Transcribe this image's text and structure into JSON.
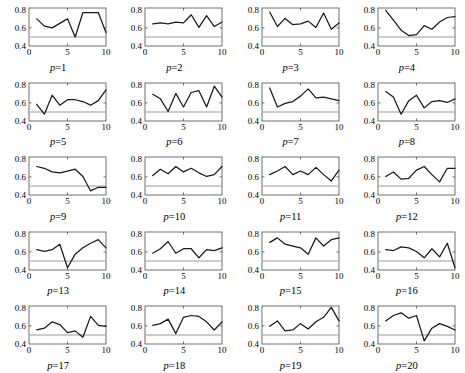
{
  "figure": {
    "layout": {
      "rows": 5,
      "cols": 4,
      "panels": 20
    },
    "background_color": "#ffffff",
    "line_color": "#1a1a1a",
    "reference_line_color": "#9a9a9a",
    "axis_color": "#4d4d4d"
  },
  "chart_data": [
    {
      "type": "line",
      "title": "p=1",
      "label_prefix": "p",
      "label_value": "1",
      "xlabel": "",
      "ylabel": "",
      "xlim": [
        0,
        10
      ],
      "ylim": [
        0.4,
        0.82
      ],
      "xticks": [
        0,
        5,
        10
      ],
      "xtick_labels": [
        "0",
        "5",
        "10"
      ],
      "yticks": [
        0.4,
        0.6,
        0.8
      ],
      "ytick_labels": [
        "0.4",
        "0.6",
        "0.8"
      ],
      "grid": false,
      "x": [
        1,
        2,
        3,
        4,
        5,
        6,
        7,
        8,
        9,
        10
      ],
      "values": [
        0.7,
        0.62,
        0.6,
        0.65,
        0.7,
        0.5,
        0.77,
        0.77,
        0.77,
        0.55
      ],
      "reference_line": 0.5
    },
    {
      "type": "line",
      "title": "p=2",
      "label_prefix": "p",
      "label_value": "2",
      "xlim": [
        0,
        10
      ],
      "ylim": [
        0.4,
        0.82
      ],
      "xticks": [
        0,
        5,
        10
      ],
      "xtick_labels": [
        "0",
        "5",
        "10"
      ],
      "yticks": [
        0.4,
        0.6,
        0.8
      ],
      "ytick_labels": [
        "0.4",
        "0.6",
        "0.8"
      ],
      "grid": false,
      "x": [
        1,
        2,
        3,
        4,
        5,
        6,
        7,
        8,
        9,
        10
      ],
      "values": [
        0.645,
        0.655,
        0.645,
        0.665,
        0.655,
        0.745,
        0.605,
        0.735,
        0.615,
        0.665
      ],
      "reference_line": 0.5
    },
    {
      "type": "line",
      "title": "p=3",
      "label_prefix": "p",
      "label_value": "3",
      "xlim": [
        0,
        10
      ],
      "ylim": [
        0.4,
        0.82
      ],
      "xticks": [
        0,
        5,
        10
      ],
      "xtick_labels": [
        "0",
        "5",
        "10"
      ],
      "yticks": [
        0.4,
        0.6,
        0.8
      ],
      "ytick_labels": [
        "0.4",
        "0.6",
        "0.8"
      ],
      "grid": false,
      "x": [
        1,
        2,
        3,
        4,
        5,
        6,
        7,
        8,
        9,
        10
      ],
      "values": [
        0.775,
        0.615,
        0.705,
        0.635,
        0.645,
        0.675,
        0.605,
        0.765,
        0.585,
        0.655
      ],
      "reference_line": 0.5
    },
    {
      "type": "line",
      "title": "p=4",
      "label_prefix": "p",
      "label_value": "4",
      "xlim": [
        0,
        10
      ],
      "ylim": [
        0.4,
        0.82
      ],
      "xticks": [
        0,
        5,
        10
      ],
      "xtick_labels": [
        "0",
        "5",
        "10"
      ],
      "yticks": [
        0.4,
        0.6,
        0.8
      ],
      "ytick_labels": [
        "0.4",
        "0.6",
        "0.8"
      ],
      "grid": false,
      "x": [
        1,
        2,
        3,
        4,
        5,
        6,
        7,
        8,
        9,
        10
      ],
      "values": [
        0.795,
        0.685,
        0.575,
        0.515,
        0.525,
        0.625,
        0.585,
        0.665,
        0.715,
        0.725
      ],
      "reference_line": 0.5
    },
    {
      "type": "line",
      "title": "p=5",
      "label_prefix": "p",
      "label_value": "5",
      "xlim": [
        0,
        10
      ],
      "ylim": [
        0.4,
        0.82
      ],
      "xticks": [
        0,
        5,
        10
      ],
      "xtick_labels": [
        "0",
        "5",
        "10"
      ],
      "yticks": [
        0.4,
        0.6,
        0.8
      ],
      "ytick_labels": [
        "0.4",
        "0.6",
        "0.8"
      ],
      "grid": false,
      "x": [
        1,
        2,
        3,
        4,
        5,
        6,
        7,
        8,
        9,
        10
      ],
      "values": [
        0.585,
        0.475,
        0.685,
        0.575,
        0.635,
        0.635,
        0.615,
        0.575,
        0.625,
        0.745
      ],
      "reference_line": 0.5
    },
    {
      "type": "line",
      "title": "p=6",
      "label_prefix": "p",
      "label_value": "6",
      "xlim": [
        0,
        10
      ],
      "ylim": [
        0.4,
        0.82
      ],
      "xticks": [
        0,
        5,
        10
      ],
      "xtick_labels": [
        "0",
        "5",
        "10"
      ],
      "yticks": [
        0.4,
        0.6,
        0.8
      ],
      "ytick_labels": [
        "0.4",
        "0.6",
        "0.8"
      ],
      "grid": false,
      "x": [
        1,
        2,
        3,
        4,
        5,
        6,
        7,
        8,
        9,
        10
      ],
      "values": [
        0.695,
        0.645,
        0.505,
        0.705,
        0.555,
        0.715,
        0.735,
        0.555,
        0.785,
        0.665
      ],
      "reference_line": 0.5
    },
    {
      "type": "line",
      "title": "p=7",
      "label_prefix": "p",
      "label_value": "7",
      "xlim": [
        0,
        10
      ],
      "ylim": [
        0.4,
        0.82
      ],
      "xticks": [
        0,
        5,
        10
      ],
      "xtick_labels": [
        "0",
        "5",
        "10"
      ],
      "yticks": [
        0.4,
        0.6,
        0.8
      ],
      "ytick_labels": [
        "0.4",
        "0.6",
        "0.8"
      ],
      "grid": false,
      "x": [
        1,
        2,
        3,
        4,
        5,
        6,
        7,
        8,
        9,
        10
      ],
      "values": [
        0.765,
        0.555,
        0.595,
        0.615,
        0.675,
        0.755,
        0.655,
        0.665,
        0.645,
        0.625
      ],
      "reference_line": 0.5
    },
    {
      "type": "line",
      "title": "p=8",
      "label_prefix": "p",
      "label_value": "8",
      "xlim": [
        0,
        10
      ],
      "ylim": [
        0.4,
        0.82
      ],
      "xticks": [
        0,
        5,
        10
      ],
      "xtick_labels": [
        "0",
        "5",
        "10"
      ],
      "yticks": [
        0.4,
        0.6,
        0.8
      ],
      "ytick_labels": [
        "0.4",
        "0.6",
        "0.8"
      ],
      "grid": false,
      "x": [
        1,
        2,
        3,
        4,
        5,
        6,
        7,
        8,
        9,
        10
      ],
      "values": [
        0.725,
        0.665,
        0.475,
        0.625,
        0.685,
        0.545,
        0.615,
        0.625,
        0.605,
        0.645
      ],
      "reference_line": 0.5
    },
    {
      "type": "line",
      "title": "p=9",
      "label_prefix": "p",
      "label_value": "9",
      "xlim": [
        0,
        10
      ],
      "ylim": [
        0.4,
        0.82
      ],
      "xticks": [
        0,
        5,
        10
      ],
      "xtick_labels": [
        "0",
        "5",
        "10"
      ],
      "yticks": [
        0.4,
        0.6,
        0.8
      ],
      "ytick_labels": [
        "0.4",
        "0.6",
        "0.8"
      ],
      "grid": false,
      "x": [
        1,
        2,
        3,
        4,
        5,
        6,
        7,
        8,
        9,
        10
      ],
      "values": [
        0.715,
        0.695,
        0.655,
        0.645,
        0.665,
        0.685,
        0.605,
        0.445,
        0.485,
        0.485
      ],
      "reference_line": 0.5
    },
    {
      "type": "line",
      "title": "p=10",
      "label_prefix": "p",
      "label_value": "10",
      "xlim": [
        0,
        10
      ],
      "ylim": [
        0.4,
        0.82
      ],
      "xticks": [
        0,
        5,
        10
      ],
      "xtick_labels": [
        "0",
        "5",
        "10"
      ],
      "yticks": [
        0.4,
        0.6,
        0.8
      ],
      "ytick_labels": [
        "0.4",
        "0.6",
        "0.8"
      ],
      "grid": false,
      "x": [
        1,
        2,
        3,
        4,
        5,
        6,
        7,
        8,
        9,
        10
      ],
      "values": [
        0.615,
        0.685,
        0.635,
        0.715,
        0.655,
        0.695,
        0.645,
        0.605,
        0.625,
        0.715
      ],
      "reference_line": 0.5
    },
    {
      "type": "line",
      "title": "p=11",
      "label_prefix": "p",
      "label_value": "11",
      "xlim": [
        0,
        10
      ],
      "ylim": [
        0.4,
        0.82
      ],
      "xticks": [
        0,
        5,
        10
      ],
      "xtick_labels": [
        "0",
        "5",
        "10"
      ],
      "yticks": [
        0.4,
        0.6,
        0.8
      ],
      "ytick_labels": [
        "0.4",
        "0.6",
        "0.8"
      ],
      "grid": false,
      "x": [
        1,
        2,
        3,
        4,
        5,
        6,
        7,
        8,
        9,
        10
      ],
      "values": [
        0.625,
        0.665,
        0.715,
        0.625,
        0.665,
        0.625,
        0.705,
        0.625,
        0.555,
        0.675
      ],
      "reference_line": 0.5
    },
    {
      "type": "line",
      "title": "p=12",
      "label_prefix": "p",
      "label_value": "12",
      "xlim": [
        0,
        10
      ],
      "ylim": [
        0.4,
        0.82
      ],
      "xticks": [
        0,
        5,
        10
      ],
      "xtick_labels": [
        "0",
        "5",
        "10"
      ],
      "yticks": [
        0.4,
        0.6,
        0.8
      ],
      "ytick_labels": [
        "0.4",
        "0.6",
        "0.8"
      ],
      "grid": false,
      "x": [
        1,
        2,
        3,
        4,
        5,
        6,
        7,
        8,
        9,
        10
      ],
      "values": [
        0.605,
        0.655,
        0.575,
        0.585,
        0.675,
        0.715,
        0.625,
        0.545,
        0.695,
        0.695
      ],
      "reference_line": 0.5
    },
    {
      "type": "line",
      "title": "p=13",
      "label_prefix": "p",
      "label_value": "13",
      "xlim": [
        0,
        10
      ],
      "ylim": [
        0.4,
        0.82
      ],
      "xticks": [
        0,
        5,
        10
      ],
      "xtick_labels": [
        "0",
        "5",
        "10"
      ],
      "yticks": [
        0.4,
        0.6,
        0.8
      ],
      "ytick_labels": [
        "0.4",
        "0.6",
        "0.8"
      ],
      "grid": false,
      "x": [
        1,
        2,
        3,
        4,
        5,
        6,
        7,
        8,
        9,
        10
      ],
      "values": [
        0.625,
        0.605,
        0.625,
        0.685,
        0.425,
        0.575,
        0.645,
        0.695,
        0.735,
        0.645
      ],
      "reference_line": 0.5
    },
    {
      "type": "line",
      "title": "p=14",
      "label_prefix": "p",
      "label_value": "14",
      "xlim": [
        0,
        10
      ],
      "ylim": [
        0.4,
        0.82
      ],
      "xticks": [
        0,
        5,
        10
      ],
      "xtick_labels": [
        "0",
        "5",
        "10"
      ],
      "yticks": [
        0.4,
        0.6,
        0.8
      ],
      "ytick_labels": [
        "0.4",
        "0.6",
        "0.8"
      ],
      "grid": false,
      "x": [
        1,
        2,
        3,
        4,
        5,
        6,
        7,
        8,
        9,
        10
      ],
      "values": [
        0.585,
        0.635,
        0.715,
        0.585,
        0.635,
        0.635,
        0.535,
        0.625,
        0.615,
        0.645
      ],
      "reference_line": 0.5
    },
    {
      "type": "line",
      "title": "p=15",
      "label_prefix": "p",
      "label_value": "15",
      "xlim": [
        0,
        10
      ],
      "ylim": [
        0.4,
        0.82
      ],
      "xticks": [
        0,
        5,
        10
      ],
      "xtick_labels": [
        "0",
        "5",
        "10"
      ],
      "yticks": [
        0.4,
        0.6,
        0.8
      ],
      "ytick_labels": [
        "0.4",
        "0.6",
        "0.8"
      ],
      "grid": false,
      "x": [
        1,
        2,
        3,
        4,
        5,
        6,
        7,
        8,
        9,
        10
      ],
      "values": [
        0.705,
        0.755,
        0.685,
        0.665,
        0.645,
        0.575,
        0.755,
        0.665,
        0.735,
        0.755
      ],
      "reference_line": 0.5
    },
    {
      "type": "line",
      "title": "p=16",
      "label_prefix": "p",
      "label_value": "16",
      "xlim": [
        0,
        10
      ],
      "ylim": [
        0.4,
        0.82
      ],
      "xticks": [
        0,
        5,
        10
      ],
      "xtick_labels": [
        "0",
        "5",
        "10"
      ],
      "yticks": [
        0.4,
        0.6,
        0.8
      ],
      "ytick_labels": [
        "0.4",
        "0.6",
        "0.8"
      ],
      "grid": false,
      "x": [
        1,
        2,
        3,
        4,
        5,
        6,
        7,
        8,
        9,
        10
      ],
      "values": [
        0.625,
        0.615,
        0.655,
        0.645,
        0.605,
        0.535,
        0.635,
        0.545,
        0.695,
        0.425
      ],
      "reference_line": 0.5
    },
    {
      "type": "line",
      "title": "p=17",
      "label_prefix": "p",
      "label_value": "17",
      "xlim": [
        0,
        10
      ],
      "ylim": [
        0.4,
        0.82
      ],
      "xticks": [
        0,
        5,
        10
      ],
      "xtick_labels": [
        "0",
        "5",
        "10"
      ],
      "yticks": [
        0.4,
        0.6,
        0.8
      ],
      "ytick_labels": [
        "0.4",
        "0.6",
        "0.8"
      ],
      "grid": false,
      "x": [
        1,
        2,
        3,
        4,
        5,
        6,
        7,
        8,
        9,
        10
      ],
      "values": [
        0.555,
        0.575,
        0.645,
        0.615,
        0.525,
        0.545,
        0.475,
        0.705,
        0.605,
        0.595
      ],
      "reference_line": 0.5
    },
    {
      "type": "line",
      "title": "p=18",
      "label_prefix": "p",
      "label_value": "18",
      "xlim": [
        0,
        10
      ],
      "ylim": [
        0.4,
        0.82
      ],
      "xticks": [
        0,
        5,
        10
      ],
      "xtick_labels": [
        "0",
        "5",
        "10"
      ],
      "yticks": [
        0.4,
        0.6,
        0.8
      ],
      "ytick_labels": [
        "0.4",
        "0.6",
        "0.8"
      ],
      "grid": false,
      "x": [
        1,
        2,
        3,
        4,
        5,
        6,
        7,
        8,
        9,
        10
      ],
      "values": [
        0.605,
        0.625,
        0.675,
        0.515,
        0.695,
        0.715,
        0.705,
        0.645,
        0.555,
        0.645
      ],
      "reference_line": 0.5
    },
    {
      "type": "line",
      "title": "p=19",
      "label_prefix": "p",
      "label_value": "19",
      "xlim": [
        0,
        10
      ],
      "ylim": [
        0.4,
        0.82
      ],
      "xticks": [
        0,
        5,
        10
      ],
      "xtick_labels": [
        "0",
        "5",
        "10"
      ],
      "yticks": [
        0.4,
        0.6,
        0.8
      ],
      "ytick_labels": [
        "0.4",
        "0.6",
        "0.8"
      ],
      "grid": false,
      "x": [
        1,
        2,
        3,
        4,
        5,
        6,
        7,
        8,
        9,
        10
      ],
      "values": [
        0.595,
        0.655,
        0.545,
        0.555,
        0.625,
        0.565,
        0.645,
        0.695,
        0.805,
        0.655
      ],
      "reference_line": 0.5
    },
    {
      "type": "line",
      "title": "p=20",
      "label_prefix": "p",
      "label_value": "20",
      "xlim": [
        0,
        10
      ],
      "ylim": [
        0.4,
        0.82
      ],
      "xticks": [
        0,
        5,
        10
      ],
      "xtick_labels": [
        "0",
        "5",
        "10"
      ],
      "yticks": [
        0.4,
        0.6,
        0.8
      ],
      "ytick_labels": [
        "0.4",
        "0.6",
        "0.8"
      ],
      "grid": false,
      "x": [
        1,
        2,
        3,
        4,
        5,
        6,
        7,
        8,
        9,
        10
      ],
      "values": [
        0.655,
        0.715,
        0.745,
        0.685,
        0.715,
        0.435,
        0.575,
        0.625,
        0.595,
        0.555
      ],
      "reference_line": 0.5
    }
  ]
}
